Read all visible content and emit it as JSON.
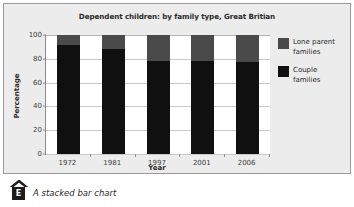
{
  "figure": {
    "caption": "A stacked bar chart",
    "badge_label": "E",
    "caret_icon": "caret-up-icon"
  },
  "legend": {
    "position": "right",
    "items": [
      {
        "label": "Lone parent\nfamilies",
        "color": "#4a4a4a",
        "swatch_icon": "legend-swatch-icon"
      },
      {
        "label": "Couple\nfamilies",
        "color": "#101010",
        "swatch_icon": "legend-swatch-icon"
      }
    ]
  },
  "chart_data": {
    "type": "bar",
    "stacked": true,
    "title": "Dependent children: by family type, Great Britian",
    "xlabel": "Year",
    "ylabel": "Percentage",
    "categories": [
      "1972",
      "1981",
      "1997",
      "2001",
      "2006"
    ],
    "ylim": [
      0,
      100
    ],
    "yticks": [
      0,
      20,
      40,
      60,
      80,
      100
    ],
    "ytick_labels": [
      "0",
      "20",
      "40",
      "60",
      "80",
      "100"
    ],
    "grid": true,
    "series": [
      {
        "name": "Couple families",
        "color": "#101010",
        "values": [
          92,
          88,
          78,
          78,
          77
        ]
      },
      {
        "name": "Lone parent families",
        "color": "#4a4a4a",
        "values": [
          8,
          12,
          22,
          22,
          23
        ]
      }
    ]
  }
}
